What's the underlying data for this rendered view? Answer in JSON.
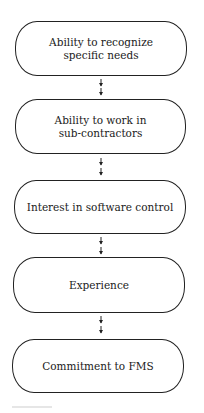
{
  "diagram": {
    "type": "flowchart",
    "direction": "top-to-bottom",
    "stroke_color": "#222222",
    "background_color": "#ffffff",
    "nodes": [
      {
        "id": "n1",
        "label": "Ability to recognize specific needs",
        "lines": [
          "Ability to recognize",
          "specific needs"
        ]
      },
      {
        "id": "n2",
        "label": "Ability to work in sub-contractors",
        "lines": [
          "Ability to work in",
          "sub-contractors"
        ]
      },
      {
        "id": "n3",
        "label": "Interest in software control",
        "lines": [
          "Interest in software control"
        ]
      },
      {
        "id": "n4",
        "label": "Experience",
        "lines": [
          "Experience"
        ]
      },
      {
        "id": "n5",
        "label": "Commitment to FMS",
        "lines": [
          "Commitment to FMS"
        ]
      }
    ],
    "edges": [
      {
        "from": "n1",
        "to": "n2",
        "style": "double-arrow-down"
      },
      {
        "from": "n2",
        "to": "n3",
        "style": "double-arrow-down"
      },
      {
        "from": "n3",
        "to": "n4",
        "style": "double-arrow-down"
      },
      {
        "from": "n4",
        "to": "n5",
        "style": "double-arrow-down"
      }
    ]
  }
}
